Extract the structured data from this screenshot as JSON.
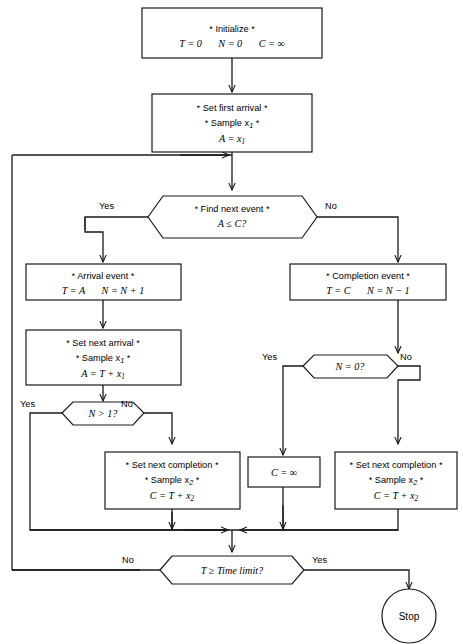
{
  "diagram": {
    "background_color": "#ffffff",
    "line_color": "#1a1a1a",
    "text_color": "#000000"
  },
  "nodes": {
    "initialize": {
      "shape": "process",
      "line1": "* Initialize *",
      "line2_a": "T = 0",
      "line2_b": "N = 0",
      "line2_c": "C = ∞"
    },
    "set_first_arrival": {
      "shape": "process",
      "line1": "* Set first arrival *",
      "line2": "* Sample x",
      "line2_sub": "1",
      "line2_end": " *",
      "line3": "A = x",
      "line3_sub": "1"
    },
    "find_next_event": {
      "shape": "decision",
      "line1": "* Find next event *",
      "line2": "A ≤ C?",
      "yes_label": "Yes",
      "no_label": "No"
    },
    "arrival_event": {
      "shape": "process",
      "line1": "* Arrival event *",
      "line2_a": "T = A",
      "line2_b": "N = N + 1"
    },
    "completion_event": {
      "shape": "process",
      "line1": "* Completion event *",
      "line2_a": "T = C",
      "line2_b": "N = N − 1"
    },
    "set_next_arrival": {
      "shape": "process",
      "line1": "* Set next arrival *",
      "line2": "* Sample x",
      "line2_sub": "1",
      "line2_end": " *",
      "line3": "A = T + x",
      "line3_sub": "1"
    },
    "n_gt_1": {
      "shape": "decision",
      "line1": "N > 1?",
      "yes_label": "Yes",
      "no_label": "No"
    },
    "n_eq_0": {
      "shape": "decision",
      "line1": "N = 0?",
      "yes_label": "Yes",
      "no_label": "No"
    },
    "set_next_completion_left": {
      "shape": "process",
      "line1": "* Set next completion *",
      "line2": "* Sample x",
      "line2_sub": "2",
      "line2_end": " *",
      "line3": "C = T + x",
      "line3_sub": "2"
    },
    "c_infinity": {
      "shape": "process",
      "line1": "C = ∞"
    },
    "set_next_completion_right": {
      "shape": "process",
      "line1": "* Set next completion *",
      "line2": "* Sample x",
      "line2_sub": "2",
      "line2_end": " *",
      "line3": "C = T + x",
      "line3_sub": "2"
    },
    "time_limit": {
      "shape": "decision",
      "line1": "T ≥ Time limit?",
      "no_label": "No",
      "yes_label": "Yes"
    },
    "stop": {
      "shape": "terminator-circle",
      "label": "Stop"
    }
  }
}
